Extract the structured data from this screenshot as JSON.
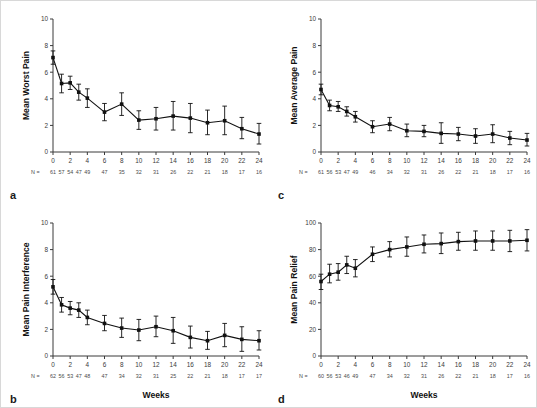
{
  "figure": {
    "n_prefix": "N =",
    "panels": [
      "a",
      "b",
      "c",
      "d"
    ]
  },
  "chart_data": [
    {
      "panel": "a",
      "type": "line",
      "title": "",
      "xlabel": "",
      "ylabel": "Mean Worst Pain",
      "xlim": [
        0,
        24
      ],
      "ylim": [
        0,
        10
      ],
      "xticks": [
        0,
        2,
        4,
        6,
        8,
        10,
        12,
        14,
        16,
        18,
        20,
        22,
        24
      ],
      "yticks": [
        0,
        2,
        4,
        6,
        8,
        10
      ],
      "grid": false,
      "legend": "none",
      "x": [
        0,
        1,
        2,
        3,
        4,
        6,
        8,
        10,
        12,
        14,
        16,
        18,
        20,
        22,
        24
      ],
      "values": [
        7.1,
        5.15,
        5.2,
        4.5,
        4.05,
        3.0,
        3.6,
        2.4,
        2.5,
        2.7,
        2.55,
        2.2,
        2.35,
        1.75,
        1.35
      ],
      "err_low": [
        0.5,
        0.7,
        0.5,
        0.6,
        0.7,
        0.65,
        0.85,
        0.7,
        0.85,
        1.05,
        1.1,
        0.9,
        1.05,
        0.75,
        0.75
      ],
      "err_high": [
        0.5,
        0.7,
        0.5,
        0.6,
        0.7,
        0.65,
        0.85,
        0.7,
        0.85,
        1.1,
        1.1,
        0.95,
        1.1,
        0.85,
        0.8
      ],
      "n_values": [
        61,
        57,
        54,
        47,
        49,
        47,
        35,
        32,
        31,
        26,
        22,
        21,
        18,
        17,
        16
      ]
    },
    {
      "panel": "b",
      "type": "line",
      "title": "",
      "xlabel": "Weeks",
      "ylabel": "Mean Pain Interference",
      "xlim": [
        0,
        24
      ],
      "ylim": [
        0,
        10
      ],
      "xticks": [
        0,
        2,
        4,
        6,
        8,
        10,
        12,
        14,
        16,
        18,
        20,
        22,
        24
      ],
      "yticks": [
        0,
        2,
        4,
        6,
        8,
        10
      ],
      "grid": false,
      "legend": "none",
      "x": [
        0,
        1,
        2,
        3,
        4,
        6,
        8,
        10,
        12,
        14,
        16,
        18,
        20,
        22,
        24
      ],
      "values": [
        5.2,
        3.85,
        3.6,
        3.45,
        2.9,
        2.45,
        2.1,
        1.95,
        2.2,
        1.9,
        1.4,
        1.15,
        1.55,
        1.25,
        1.15
      ],
      "err_low": [
        0.55,
        0.55,
        0.5,
        0.55,
        0.55,
        0.55,
        0.7,
        0.8,
        0.75,
        0.95,
        0.8,
        0.65,
        0.85,
        0.9,
        0.7
      ],
      "err_high": [
        0.55,
        0.55,
        0.5,
        0.55,
        0.55,
        0.6,
        0.75,
        0.8,
        0.8,
        1.0,
        0.85,
        0.7,
        0.9,
        0.95,
        0.75
      ],
      "n_values": [
        62,
        56,
        53,
        47,
        48,
        47,
        34,
        32,
        31,
        25,
        22,
        21,
        18,
        17,
        17
      ]
    },
    {
      "panel": "c",
      "type": "line",
      "title": "",
      "xlabel": "",
      "ylabel": "Mean Average Pain",
      "xlim": [
        0,
        24
      ],
      "ylim": [
        0,
        10
      ],
      "xticks": [
        0,
        2,
        4,
        6,
        8,
        10,
        12,
        14,
        16,
        18,
        20,
        22,
        24
      ],
      "yticks": [
        0,
        2,
        4,
        6,
        8,
        10
      ],
      "grid": false,
      "legend": "none",
      "x": [
        0,
        1,
        2,
        3,
        4,
        6,
        8,
        10,
        12,
        14,
        16,
        18,
        20,
        22,
        24
      ],
      "values": [
        4.7,
        3.5,
        3.4,
        3.05,
        2.65,
        1.9,
        2.1,
        1.6,
        1.55,
        1.4,
        1.35,
        1.2,
        1.35,
        1.05,
        0.9
      ],
      "err_low": [
        0.4,
        0.4,
        0.35,
        0.35,
        0.4,
        0.45,
        0.5,
        0.45,
        0.4,
        0.75,
        0.5,
        0.55,
        0.65,
        0.5,
        0.45
      ],
      "err_high": [
        0.4,
        0.4,
        0.4,
        0.35,
        0.4,
        0.45,
        0.5,
        0.5,
        0.45,
        0.8,
        0.5,
        0.55,
        0.7,
        0.5,
        0.5
      ],
      "n_values": [
        61,
        56,
        53,
        47,
        49,
        46,
        34,
        32,
        31,
        26,
        22,
        21,
        18,
        17,
        16
      ]
    },
    {
      "panel": "d",
      "type": "line",
      "title": "",
      "xlabel": "Weeks",
      "ylabel": "Mean Pain Relief",
      "xlim": [
        0,
        24
      ],
      "ylim": [
        0,
        100
      ],
      "xticks": [
        0,
        2,
        4,
        6,
        8,
        10,
        12,
        14,
        16,
        18,
        20,
        22,
        24
      ],
      "yticks": [
        0,
        20,
        40,
        60,
        80,
        100
      ],
      "grid": false,
      "legend": "none",
      "x": [
        0,
        1,
        2,
        3,
        4,
        6,
        8,
        10,
        12,
        14,
        16,
        18,
        20,
        22,
        24
      ],
      "values": [
        56,
        61.5,
        63,
        68.5,
        66,
        76.5,
        80,
        82,
        84,
        84.5,
        86,
        86.5,
        86.5,
        86.5,
        87
      ],
      "err_low": [
        6,
        6.5,
        6,
        6.5,
        6.5,
        5.5,
        5.5,
        7,
        6.5,
        7.5,
        6.5,
        7,
        7,
        8,
        8
      ],
      "err_high": [
        5.5,
        7.5,
        6.5,
        6.5,
        6.5,
        5.5,
        6,
        7.5,
        7,
        8,
        7,
        7.5,
        7.5,
        8,
        8
      ],
      "n_values": [
        60,
        56,
        53,
        46,
        49,
        47,
        34,
        32,
        31,
        26,
        22,
        21,
        18,
        17,
        16
      ]
    }
  ],
  "colors": {
    "line": "#111111",
    "axis": "#3a3a3a",
    "background": "#ffffff",
    "border": "#d8d8d8",
    "text": "#1a1a1a"
  }
}
